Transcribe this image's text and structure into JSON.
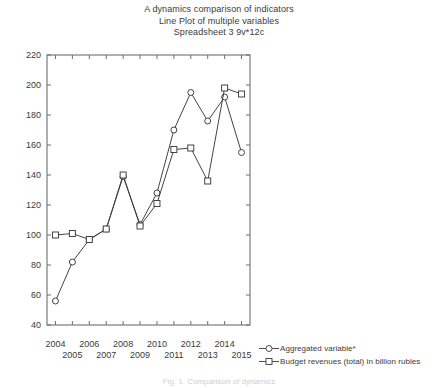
{
  "titles": {
    "line1": "A dynamics comparison of indicators",
    "line2": "Line Plot of multiple variables",
    "line3": "Spreadsheet 3 9v*12c"
  },
  "caption": "Fig. 1. Comparison of dynamics",
  "legend": {
    "position": "bottom-right",
    "items": [
      {
        "label": "Aggregated variable*",
        "marker": "circle-marker-icon"
      },
      {
        "label": "Budget revenues (total) in billion rubles",
        "marker": "square-marker-icon"
      }
    ]
  },
  "axes": {
    "y_ticks": [
      "220",
      "200",
      "180",
      "160",
      "140",
      "120",
      "100",
      "80",
      "60",
      "40"
    ],
    "x_ticks_top": [
      "2004",
      "2006",
      "2008",
      "2010",
      "2012",
      "2014"
    ],
    "x_ticks_bottom": [
      "2005",
      "2007",
      "2009",
      "2011",
      "2013",
      "2015"
    ]
  },
  "colors": {
    "series_1": "#3a3a3a",
    "series_2": "#3a3a3a",
    "axis": "#6f6f6f",
    "text": "#3a3a3a",
    "background": "#ffffff"
  },
  "chart_data": {
    "type": "line",
    "title": "A dynamics comparison of indicators",
    "subtitle": "Line Plot of multiple variables",
    "xlabel": "",
    "ylabel": "",
    "xlim": [
      2003.5,
      2015.5
    ],
    "ylim": [
      40,
      220
    ],
    "ytick_step": 20,
    "grid": false,
    "legend_position": "bottom-right",
    "x": [
      2004,
      2005,
      2006,
      2007,
      2008,
      2009,
      2010,
      2011,
      2012,
      2013,
      2014,
      2015
    ],
    "series": [
      {
        "name": "Aggregated variable*",
        "marker": "circle",
        "values": [
          56,
          82,
          97,
          104,
          139,
          107,
          128,
          170,
          195,
          176,
          192,
          155
        ]
      },
      {
        "name": "Budget revenues (total) in billion rubles",
        "marker": "square",
        "values": [
          100,
          101,
          97,
          104,
          140,
          106,
          121,
          157,
          158,
          136,
          198,
          194
        ]
      }
    ]
  }
}
